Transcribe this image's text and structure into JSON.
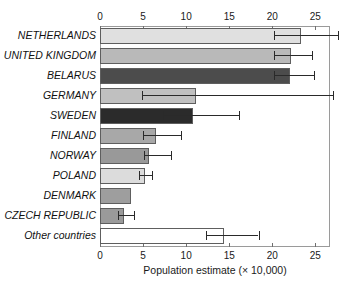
{
  "chart_data": {
    "type": "bar",
    "orientation": "horizontal",
    "title": "",
    "xlabel": "Population estimate (× 10,000)",
    "ylabel": "",
    "xlim": [
      0,
      26.7
    ],
    "xticks": [
      0,
      5,
      10,
      15,
      20,
      25
    ],
    "xtick_labels": [
      "0",
      "5",
      "10",
      "15",
      "20",
      "25"
    ],
    "grid": false,
    "legend": null,
    "axis_positions": [
      "top",
      "bottom"
    ],
    "categories": [
      "NETHERLANDS",
      "UNITED KINGDOM",
      "BELARUS",
      "GERMANY",
      "SWEDEN",
      "FINLAND",
      "NORWAY",
      "POLAND",
      "DENMARK",
      "CZECH REPUBLIC",
      "Other countries"
    ],
    "values": [
      23.3,
      22.2,
      22.1,
      11.2,
      10.8,
      6.5,
      5.7,
      5.2,
      3.6,
      2.8,
      14.4
    ],
    "error_low": [
      20.2,
      20.2,
      20.2,
      4.9,
      7.3,
      5.0,
      5.1,
      4.5,
      null,
      2.1,
      12.3
    ],
    "error_high": [
      27.6,
      24.6,
      24.8,
      27.0,
      16.1,
      9.4,
      8.2,
      6.0,
      null,
      4.0,
      18.4
    ],
    "bar_colors": [
      "#e0e0e0",
      "#b9b9b9",
      "#4c4c4c",
      "#c0c0c0",
      "#2b2b2b",
      "#a8a8a8",
      "#999999",
      "#dcdcdc",
      "#9e9e9e",
      "#9a9a9a",
      "#ffffff"
    ],
    "bar_edge_color": "#5e5e5e",
    "error_bar_color": "#2a2a2a"
  },
  "chart": {
    "xlabel_text": "Population estimate (× 10,000)"
  }
}
